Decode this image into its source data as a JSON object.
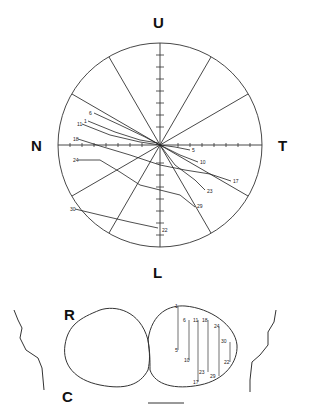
{
  "field_map": {
    "labels": {
      "up": "U",
      "down": "L",
      "nasal": "N",
      "temporal": "T"
    },
    "center": [
      160,
      145
    ],
    "radius": 102,
    "points": [
      {
        "id": "1",
        "label_pos": [
          86,
          121
        ],
        "path": [
          [
            88,
            121
          ],
          [
            115,
            132
          ],
          [
            140,
            140
          ],
          [
            158,
            143
          ]
        ]
      },
      {
        "id": "5",
        "label_pos": [
          192,
          150
        ],
        "path": [
          [
            160,
            145
          ],
          [
            175,
            147
          ],
          [
            190,
            150
          ]
        ]
      },
      {
        "id": "6",
        "label_pos": [
          92,
          113
        ],
        "path": [
          [
            94,
            113
          ],
          [
            120,
            125
          ],
          [
            145,
            137
          ],
          [
            160,
            145
          ]
        ]
      },
      {
        "id": "10",
        "label_pos": [
          200,
          162
        ],
        "path": [
          [
            160,
            145
          ],
          [
            180,
            155
          ],
          [
            198,
            162
          ]
        ]
      },
      {
        "id": "11",
        "label_pos": [
          80,
          124
        ],
        "path": [
          [
            82,
            124
          ],
          [
            110,
            135
          ],
          [
            140,
            142
          ],
          [
            160,
            145
          ]
        ]
      },
      {
        "id": "17",
        "label_pos": [
          233,
          181
        ],
        "path": [
          [
            160,
            145
          ],
          [
            185,
            160
          ],
          [
            210,
            176
          ],
          [
            231,
            181
          ]
        ]
      },
      {
        "id": "18",
        "label_pos": [
          76,
          139
        ],
        "path": [
          [
            78,
            139
          ],
          [
            100,
            146
          ],
          [
            130,
            155
          ],
          [
            160,
            165
          ],
          [
            185,
            170
          ],
          [
            210,
            174
          ]
        ]
      },
      {
        "id": "22",
        "label_pos": [
          162,
          230
        ],
        "path": [
          [
            80,
            210
          ],
          [
            110,
            218
          ],
          [
            140,
            225
          ],
          [
            160,
            229
          ]
        ]
      },
      {
        "id": "23",
        "label_pos": [
          207,
          191
        ],
        "path": [
          [
            160,
            145
          ],
          [
            175,
            165
          ],
          [
            195,
            180
          ],
          [
            205,
            190
          ]
        ]
      },
      {
        "id": "24",
        "label_pos": [
          76,
          160
        ],
        "path": [
          [
            78,
            160
          ],
          [
            100,
            160
          ],
          [
            120,
            172
          ],
          [
            140,
            185
          ],
          [
            160,
            190
          ],
          [
            175,
            195
          ],
          [
            195,
            207
          ]
        ]
      },
      {
        "id": "29",
        "label_pos": [
          197,
          206
        ],
        "path": [
          [
            135,
            185
          ],
          [
            160,
            190
          ],
          [
            180,
            195
          ],
          [
            195,
            207
          ]
        ]
      },
      {
        "id": "30",
        "label_pos": [
          73,
          209
        ],
        "path": [
          [
            75,
            209
          ],
          [
            100,
            215
          ],
          [
            130,
            222
          ],
          [
            158,
            228
          ]
        ]
      }
    ]
  },
  "brain_map": {
    "labels": {
      "rostral": "R",
      "caudal": "C"
    },
    "points": [
      "1",
      "5",
      "6",
      "10",
      "11",
      "17",
      "18",
      "22",
      "23",
      "24",
      "29",
      "30"
    ]
  }
}
